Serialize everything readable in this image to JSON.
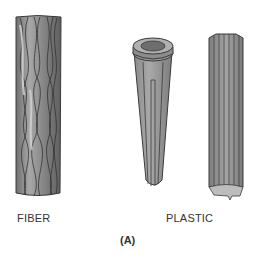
{
  "figure": {
    "items": [
      {
        "name": "fiber",
        "label": "FIBER"
      },
      {
        "name": "plastic",
        "label": "PLASTIC"
      }
    ],
    "caption": "(A)"
  }
}
